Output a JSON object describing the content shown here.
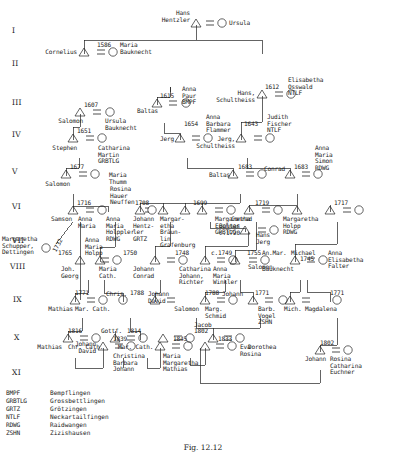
{
  "figure": {
    "caption": "Fig. 12.12",
    "generations": [
      "I",
      "II",
      "III",
      "IV",
      "V",
      "VI",
      "VII",
      "VIII",
      "IX",
      "X",
      "XI"
    ]
  },
  "legend": {
    "rows": [
      {
        "code": "BMPF",
        "place": "Bempflingen"
      },
      {
        "code": "GRBTLG",
        "place": "Grossbettlingen"
      },
      {
        "code": "GRTZ",
        "place": "Grötzingen"
      },
      {
        "code": "NTLF",
        "place": "Neckartailfingen"
      },
      {
        "code": "RDWG",
        "place": "Raidwangen"
      },
      {
        "code": "ZSHN",
        "place": "Zizishausen"
      }
    ]
  },
  "people": {
    "g1_hans": "Hans\nHentzler",
    "g1_ursula": "Ursula",
    "g2_cornelius": "Cornelius",
    "g2_maria": "Maria\nBauknecht",
    "g2_year": "1586",
    "g3_salomon": "Salomon",
    "g3_ursula": "Ursula\nBauknecht",
    "g3_year_salomon": "1607",
    "g3_baltas": "Baltas",
    "g3_anna_paur": "Anna\nPaur\nBMPF",
    "g3_year_baltas": "1615",
    "g3_hans": "Hans,\nSchultheiss",
    "g3_elisabetha": "Elisabetha\nOsswald\nNTLF",
    "g3_year_hans": "1612",
    "g4_stephen": "Stephen",
    "g4_catharina": "Catharina\nMartin\nGRBTLG",
    "g4_year_stephen": "1651",
    "g4_jerg": "Jerg",
    "g4_anna_barbara": "Anna\nBarbara\nFlammer",
    "g4_year_jerg": "1654",
    "g4_jerg2": "Jerg,\nSchultheiss",
    "g4_judith": "Judith\nFischer\nNTLF",
    "g4_year_jerg2": "1643",
    "g5_salomon": "Salomon",
    "g5_maria_thumm": "Maria\nThumm",
    "g5_year_salomon": "1677",
    "g5_baltas": "Baltas",
    "g5_rosina": "Rosina\nHauer\nNeuffen",
    "g5_year_baltas": "1683",
    "g5_conrad": "Conrad",
    "g5_anna_maria": "Anna\nMaria\nSimon\nRDWG",
    "g5_year_conrad": "1683",
    "g6_samson": "Samson",
    "g6_anna_maria": "Anna\nMaria",
    "g6_year_samson": "1716",
    "g6_anna_maria_holppler": "Anna\nMaria\nHolppler\nRDWG",
    "g6_johann_hentzler": "Johann\nHentz-\nler\nGRTZ",
    "g6_year_1708": "1708",
    "g6_baltas": "Baltas\nc.1720",
    "g6_margaretha": "Margar-\netha\nBräun-\nlin\nGrafenburg",
    "g6_year_1699": "1699",
    "g6_conrad": "Conrad",
    "g6_margaretha_euchner": "Margaretha\nEuchner\nGRBTLG",
    "g6_year_conrad": "1719",
    "g6_margaretha_holpp": "Margaretha\nHolpp\nRDWG",
    "g6_year_1717": "1717",
    "g7_margaretha_schupper": "Margaretha\nSchupper,\nDettingen",
    "g7_year_diag": "1732",
    "g7_hans_jerg": "Hans\nJerg",
    "g8_joh_georg": "Joh.\nGeorg",
    "g8_anna_maria_holpp": "Anna\nMaria\nHolpp",
    "g8_year_1765": "1765",
    "g8_maria_cath": "Maria\nCath.",
    "g8_johann_conrad": "Johann\nConrad",
    "g8_year_1750": "1750",
    "g8_catharina": "Catharina\nJohann,\nRichter",
    "g8_year_1748": "1748",
    "g8_anna_maria_winkler": "Anna\nMaria\nWinkler",
    "g8_year_c1749": "c.1749",
    "g8_salomon": "Salomon",
    "g8_an_mar": "An.Mar.",
    "g8_year_1755": "1755",
    "g8_michael": "Michael",
    "g8_bauknecht": "Bauknecht",
    "g8_year_1745": "1745",
    "g8_anna_elisabetha": "Anna\nElisabetha\nFalter",
    "g9_mathias": "Mathias",
    "g9_mar_cath": "Mar. Cath.",
    "g9_year_1771": "1771",
    "g9_chris": "Chris.",
    "g9_year_1788a": "1788",
    "g9_johann_david": "Johann\nDavid",
    "g9_salomon": "Salomon",
    "g9_marg_schmid": "Marg.\nSchmid",
    "g9_year_1788b": "1788",
    "g9_johann": "Johann",
    "g9_barb_vogel": "Barb.\nVogel\nZSHN",
    "g9_year_1771b": "1771",
    "g9_mich": "Mich.",
    "g9_magdalena": "Magdalena",
    "g9_year_1771c": "1771",
    "g10_mathias": "Mathias",
    "g10_chr_cath": "Chr. Cath.",
    "g10_year_1816": "1816",
    "g10_gottf": "Gottf.",
    "g10_mar_cath": "Mar. Cath.",
    "g10_year_1814": "1814",
    "g10_jacob": "Jacob",
    "g10_dorothea": "Dorothea",
    "g10_year_1802": "1802",
    "g10_johann": "Johann",
    "g10_rosina_catharina": "Rosina\nCatharina\nEuchner",
    "g10_year_1802b": "1802",
    "g11_johann_david": "Johann\nDavid",
    "g11_christina_barbara": "Christina\nBarbara\nJohann",
    "g11_year_1839": "1839",
    "g11_maria_margaretha": "Maria\nMargaretha\nMathias",
    "g11_year_1845": "1845",
    "g11_eva_rosina": "Eva\nRosina",
    "g11_year_1833": "1833"
  }
}
